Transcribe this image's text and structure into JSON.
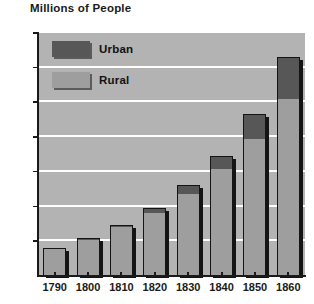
{
  "chart_data": {
    "type": "bar",
    "subtype": "stacked-bar",
    "title": "Millions of People",
    "xlabel": "",
    "ylabel": "Millions of People",
    "ylim": [
      0,
      35
    ],
    "ytick_step": 5,
    "yticks": [
      0,
      5,
      10,
      15,
      20,
      25,
      30,
      35
    ],
    "ytick_labels": [
      "5",
      "10",
      "15",
      "20",
      "25",
      "30",
      "35"
    ],
    "grid": "horizontal-white",
    "legend_position": "inside-top-left",
    "categories": [
      "1790",
      "1800",
      "1810",
      "1820",
      "1830",
      "1840",
      "1850",
      "1860"
    ],
    "series": [
      {
        "name": "Rural",
        "color": "#9e9e9e",
        "values": [
          3.7,
          5.0,
          6.9,
          9.0,
          11.7,
          15.2,
          19.6,
          25.4
        ]
      },
      {
        "name": "Urban",
        "color": "#575757",
        "values": [
          0.2,
          0.3,
          0.3,
          0.6,
          1.2,
          1.9,
          3.6,
          6.0
        ]
      }
    ],
    "totals": [
      3.9,
      5.3,
      7.2,
      9.6,
      12.9,
      17.1,
      23.2,
      31.4
    ],
    "plot_background": "#b3b3b3",
    "gridline_color": "#ffffff",
    "axis_color": "#1a1a1a"
  },
  "legend": {
    "items": [
      {
        "label": "Urban",
        "swatch": "urban"
      },
      {
        "label": "Rural",
        "swatch": "rural"
      }
    ]
  }
}
